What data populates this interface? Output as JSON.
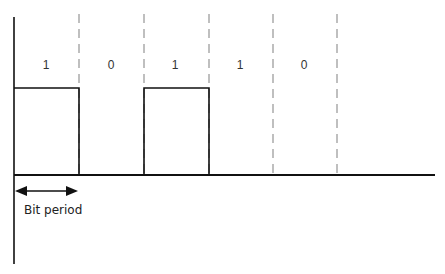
{
  "diagram": {
    "type": "digital-signal-waveform",
    "bits": [
      "1",
      "0",
      "1",
      "1",
      "0"
    ],
    "bit_period_label": "Bit period",
    "colors": {
      "signal": "#111111",
      "divider": "#b0b0b0",
      "text": "#222222"
    }
  }
}
